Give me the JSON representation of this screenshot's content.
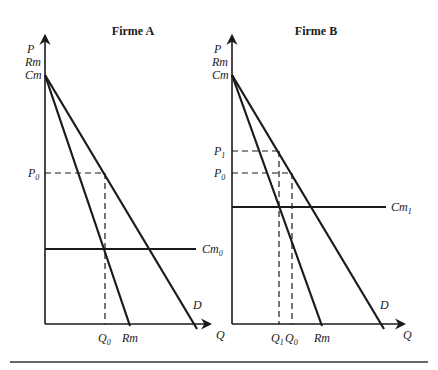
{
  "panels": [
    {
      "title": "Firme A",
      "y_axis_labels": [
        "P",
        "Rm",
        "Cm"
      ],
      "x_axis_label": "Q",
      "price_labels": [
        {
          "base": "P",
          "sub": "0"
        }
      ],
      "cost_label": {
        "base": "Cm",
        "sub": "0"
      },
      "quantity_labels": [
        {
          "base": "Q",
          "sub": "0"
        }
      ],
      "rm_label": "Rm",
      "d_label": "D"
    },
    {
      "title": "Firme B",
      "y_axis_labels": [
        "P",
        "Rm",
        "Cm"
      ],
      "x_axis_label": "Q",
      "price_labels": [
        {
          "base": "P",
          "sub": "1"
        },
        {
          "base": "P",
          "sub": "0"
        }
      ],
      "cost_label": {
        "base": "Cm",
        "sub": "1"
      },
      "quantity_labels": [
        {
          "base": "Q",
          "sub": "1"
        },
        {
          "base": "Q",
          "sub": "0"
        }
      ],
      "rm_label": "Rm",
      "d_label": "D"
    }
  ],
  "colors": {
    "ink": "#1a1a1a",
    "background": "#ffffff"
  }
}
